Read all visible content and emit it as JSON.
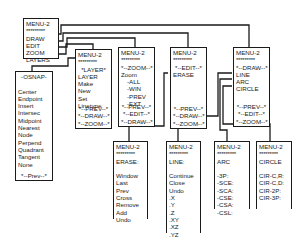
{
  "diagram": {
    "type": "menu-tree",
    "root": {
      "title": "MENU-2",
      "stars": "*********",
      "items": [
        "DRAW",
        "EDIT",
        "ZOOM",
        "LAYERS"
      ]
    },
    "osnap": {
      "title": "-OSNAP-",
      "items": [
        "Center",
        "Endpoint",
        "Insert",
        "Intersec",
        "Midpoint",
        "Nearest",
        "Node",
        "Perpend",
        "Quadrant",
        "Tangent",
        "None"
      ],
      "footer": "*--Prev--*"
    },
    "layer": {
      "title": "MENU-2",
      "stars": "*********",
      "header": "*LAYER*",
      "items": [
        "LAYER",
        "Make",
        "New",
        "Set",
        "Linetype"
      ],
      "footer": [
        "*--PREV--*",
        "*--DRAW--*",
        "*--ZOOM--*"
      ]
    },
    "zoom": {
      "title": "MENU-2",
      "stars": "*********",
      "header": "*--ZOOM--*",
      "items": [
        "Zoom",
        "-ALL",
        "-WIN",
        "-PREV",
        "-EXT"
      ],
      "footer": [
        "*--PREV--*",
        "*--EDIT--*",
        "*--DRAW--*"
      ]
    },
    "edit": {
      "title": "MENU-2",
      "stars": "*********",
      "header": "*--EDIT--*",
      "items": [
        "ERASE"
      ],
      "footer": [
        "*--PREV--*",
        "*--DRAW--*",
        "*--ZOOM--*"
      ]
    },
    "draw": {
      "title": "MENU-2",
      "stars": "*********",
      "header": "*--DRAW--*",
      "items": [
        "LINE",
        "ARC",
        "CIRCLE"
      ],
      "footer": [
        "*--PREV--*",
        "*--EDIT--*",
        "*--ZOOM--*"
      ]
    },
    "erase": {
      "title": "MENU-2",
      "stars": "*********",
      "header": "ERASE:",
      "items": [
        "Window",
        "Last",
        "Prev",
        "Cross",
        "Remove",
        "Add",
        "Undo"
      ]
    },
    "line": {
      "title": "MENU-2",
      "stars": "*********",
      "header": "LINE:",
      "items": [
        "Continue",
        "Close",
        "Undo",
        ".X",
        ".Y",
        ".Z",
        ".XY",
        ".XZ",
        ".YZ"
      ]
    },
    "arc": {
      "title": "MENU-2",
      "stars": "*********",
      "header": "ARC",
      "items": [
        "-3P:",
        "-SCE:",
        "-SCA:",
        "-CSE:",
        "-CSA:",
        "-CSL:"
      ]
    },
    "circle": {
      "title": "MENU-2",
      "stars": "*********",
      "header": "CIRCLE",
      "items": [
        "CIR-C,R:",
        "CIR-C,D:",
        "CIR-2P:",
        "CIR-3P:"
      ]
    }
  }
}
